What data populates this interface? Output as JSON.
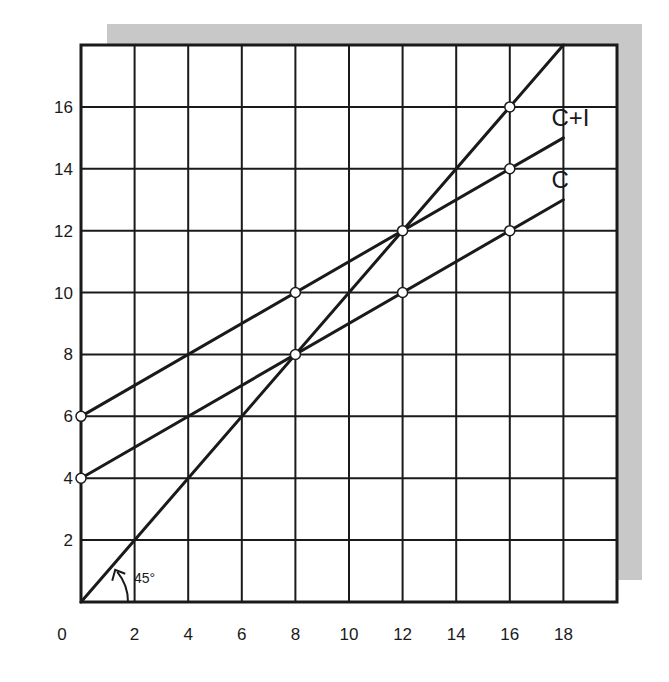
{
  "chart_data": {
    "type": "line",
    "title": "",
    "xlabel": "",
    "ylabel": "",
    "xlim": [
      0,
      20
    ],
    "ylim": [
      0,
      18
    ],
    "grid": true,
    "x_ticks": [
      0,
      2,
      4,
      6,
      8,
      10,
      12,
      14,
      16,
      18
    ],
    "y_ticks": [
      2,
      4,
      6,
      8,
      10,
      12,
      14,
      16
    ],
    "series": [
      {
        "name": "45° line",
        "label": "",
        "x": [
          0,
          18
        ],
        "y": [
          0,
          18
        ],
        "markers": [
          [
            8,
            8
          ],
          [
            12,
            12
          ],
          [
            16,
            16
          ]
        ]
      },
      {
        "name": "C+I",
        "label": "C+I",
        "x": [
          0,
          18
        ],
        "y": [
          6,
          15
        ],
        "markers": [
          [
            0,
            6
          ],
          [
            8,
            10
          ],
          [
            12,
            12
          ],
          [
            16,
            14
          ]
        ]
      },
      {
        "name": "C",
        "label": "C",
        "x": [
          0,
          18
        ],
        "y": [
          4,
          13
        ],
        "markers": [
          [
            0,
            4
          ],
          [
            8,
            8
          ],
          [
            12,
            10
          ],
          [
            16,
            12
          ]
        ]
      }
    ],
    "annotations": [
      {
        "text": "45°",
        "x": 1.6,
        "y": 0.9,
        "type": "angle-arc"
      }
    ]
  },
  "colors": {
    "ink": "#1a1a1a",
    "shadow": "#c8c8c8",
    "background": "#ffffff"
  }
}
